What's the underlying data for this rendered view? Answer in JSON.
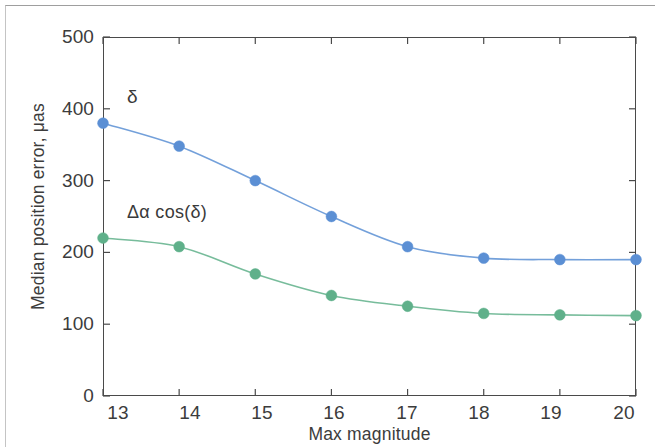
{
  "chart_data": {
    "type": "line",
    "title": "",
    "xlabel": "Max magnitude",
    "ylabel": "Median position error, μas",
    "x": [
      13,
      14,
      15,
      16,
      17,
      18,
      19,
      20
    ],
    "xtick_labels": [
      "13",
      "14",
      "15",
      "16",
      "17",
      "18",
      "19",
      "20"
    ],
    "ytick_labels": [
      "0",
      "100",
      "200",
      "300",
      "400",
      "500"
    ],
    "yticks": [
      0,
      100,
      200,
      300,
      400,
      500
    ],
    "xlim": [
      13,
      20
    ],
    "ylim": [
      0,
      500
    ],
    "grid": false,
    "legend_position": "inline-annotations",
    "series": [
      {
        "name": "δ",
        "annotation": "δ",
        "color": "#5b8fd4",
        "marker": "circle",
        "values": [
          380,
          348,
          300,
          250,
          208,
          192,
          190,
          190
        ]
      },
      {
        "name": "Δα cos(δ)",
        "annotation": "Δα cos(δ)",
        "color": "#5fb08a",
        "marker": "circle",
        "values": [
          220,
          208,
          170,
          140,
          125,
          115,
          113,
          112
        ]
      }
    ]
  },
  "axes": {
    "frame_color": "#4a4a4a",
    "tick_direction": "in"
  }
}
